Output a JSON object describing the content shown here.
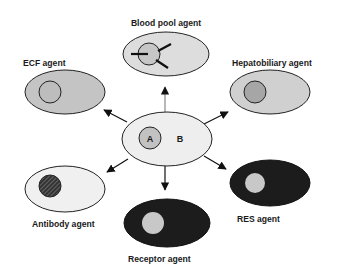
{
  "diagram": {
    "center": {
      "label_a": "A",
      "label_b": "B"
    },
    "nodes": [
      {
        "id": "blood-pool",
        "label": "Blood pool agent"
      },
      {
        "id": "ecf",
        "label": "ECF agent"
      },
      {
        "id": "hepatobiliary",
        "label": "Hepatobiliary agent"
      },
      {
        "id": "antibody",
        "label": "Antibody agent"
      },
      {
        "id": "res",
        "label": "RES agent"
      },
      {
        "id": "receptor",
        "label": "Receptor agent"
      }
    ],
    "colors": {
      "light_fill": "#eeeeee",
      "medium_fill": "#c4c4c4",
      "inner_medium": "#a8a8a8",
      "dark_fill": "#1c1c1c",
      "inner_light": "#c8c8c8",
      "stroke": "#222222"
    }
  }
}
